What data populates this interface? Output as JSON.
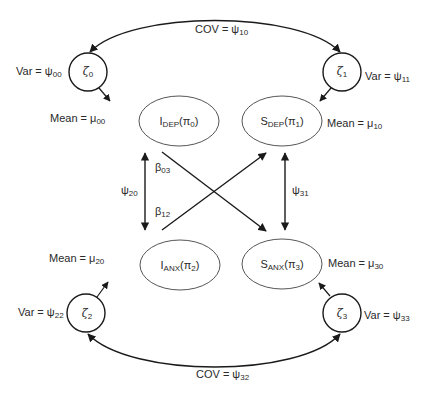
{
  "diagram": {
    "type": "latent growth / cross-lagged path model",
    "latent_factors": [
      {
        "id": "i_dep",
        "name": "I",
        "sub": "DEP",
        "param": "π",
        "param_sub": "0",
        "mean_label": "Mean = μ",
        "mean_sub": "00"
      },
      {
        "id": "s_dep",
        "name": "S",
        "sub": "DEP",
        "param": "π",
        "param_sub": "1",
        "mean_label": "Mean = μ",
        "mean_sub": "10"
      },
      {
        "id": "i_anx",
        "name": "I",
        "sub": "ANX",
        "param": "π",
        "param_sub": "2",
        "mean_label": "Mean = μ",
        "mean_sub": "20"
      },
      {
        "id": "s_anx",
        "name": "S",
        "sub": "ANX",
        "param": "π",
        "param_sub": "3",
        "mean_label": "Mean = μ",
        "mean_sub": "30"
      }
    ],
    "disturbances": [
      {
        "id": "zeta0",
        "symbol": "ζ",
        "sub": "0",
        "var_label": "Var = ψ",
        "var_sub": "00"
      },
      {
        "id": "zeta1",
        "symbol": "ζ",
        "sub": "1",
        "var_label": "Var = ψ",
        "var_sub": "11"
      },
      {
        "id": "zeta2",
        "symbol": "ζ",
        "sub": "2",
        "var_label": "Var = ψ",
        "var_sub": "22"
      },
      {
        "id": "zeta3",
        "symbol": "ζ",
        "sub": "3",
        "var_label": "Var = ψ",
        "var_sub": "33"
      }
    ],
    "paths": {
      "beta03": {
        "symbol": "β",
        "sub": "03",
        "from": "i_dep",
        "to": "s_anx"
      },
      "beta12": {
        "symbol": "β",
        "sub": "12",
        "from": "i_anx",
        "to": "s_dep"
      },
      "psi20": {
        "symbol": "ψ",
        "sub": "20",
        "between": [
          "i_dep",
          "i_anx"
        ]
      },
      "psi31": {
        "symbol": "ψ",
        "sub": "31",
        "between": [
          "s_dep",
          "s_anx"
        ]
      }
    },
    "covariances": {
      "top": {
        "label": "COV = ψ",
        "sub": "10",
        "between": [
          "zeta0",
          "zeta1"
        ]
      },
      "bottom": {
        "label": "COV = ψ",
        "sub": "32",
        "between": [
          "zeta2",
          "zeta3"
        ]
      }
    },
    "colors": {
      "stroke": "#1a1a1a",
      "ellipse_stroke": "#555555",
      "text": "#2a2a2a",
      "background": "#ffffff"
    }
  }
}
